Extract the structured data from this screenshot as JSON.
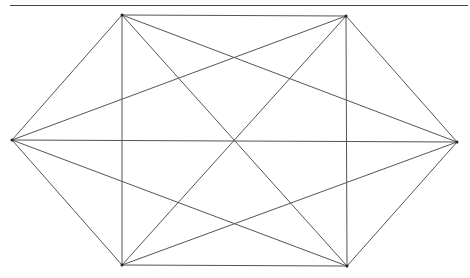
{
  "header": {
    "cut_text": ""
  },
  "diagram": {
    "type": "complete-graph-K6-hexagon",
    "stroke": "#555555",
    "vertices": [
      {
        "id": "A",
        "x": 122,
        "y": 15
      },
      {
        "id": "B",
        "x": 346,
        "y": 16
      },
      {
        "id": "C",
        "x": 457,
        "y": 142
      },
      {
        "id": "D",
        "x": 347,
        "y": 266
      },
      {
        "id": "E",
        "x": 122,
        "y": 265
      },
      {
        "id": "F",
        "x": 12,
        "y": 140
      }
    ]
  }
}
